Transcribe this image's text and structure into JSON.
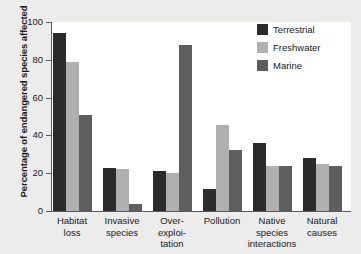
{
  "chart_data": {
    "type": "bar",
    "title": "",
    "xlabel": "",
    "ylabel": "Percentage of endangered species affected",
    "ylim": [
      0,
      100
    ],
    "yticks": [
      0,
      20,
      40,
      60,
      80,
      100
    ],
    "grid": false,
    "legend_position": "top-right",
    "categories": [
      "Habitat loss",
      "Invasive species",
      "Over-exploitation",
      "Pollution",
      "Native species interactions",
      "Natural causes"
    ],
    "category_label_lines": [
      [
        "Habitat",
        "loss"
      ],
      [
        "Invasive",
        "species"
      ],
      [
        "Over-",
        "exploi-",
        "tation"
      ],
      [
        "Pollution"
      ],
      [
        "Native",
        "species",
        "interactions"
      ],
      [
        "Natural",
        "causes"
      ]
    ],
    "series": [
      {
        "name": "Terrestrial",
        "color": "#2b2b2b",
        "values": [
          94,
          23,
          21,
          11.5,
          36,
          28
        ]
      },
      {
        "name": "Freshwater",
        "color": "#b0b0b0",
        "values": [
          79,
          22,
          20,
          45.5,
          24,
          25
        ]
      },
      {
        "name": "Marine",
        "color": "#5e5e5e",
        "values": [
          51,
          3.5,
          88,
          32.5,
          24,
          24
        ]
      }
    ]
  },
  "legend": {
    "items": [
      {
        "label": "Terrestrial"
      },
      {
        "label": "Freshwater"
      },
      {
        "label": "Marine"
      }
    ]
  }
}
